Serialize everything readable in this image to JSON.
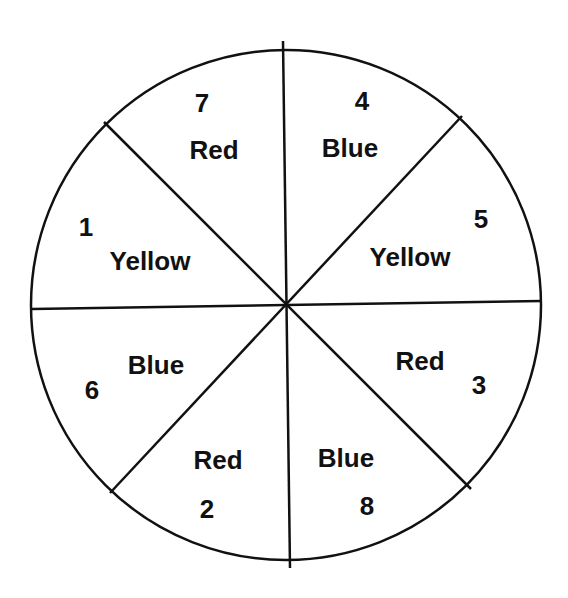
{
  "spinner": {
    "sections": [
      {
        "number": "7",
        "color": "Red"
      },
      {
        "number": "4",
        "color": "Blue"
      },
      {
        "number": "5",
        "color": "Yellow"
      },
      {
        "number": "3",
        "color": "Red"
      },
      {
        "number": "8",
        "color": "Blue"
      },
      {
        "number": "2",
        "color": "Red"
      },
      {
        "number": "6",
        "color": "Blue"
      },
      {
        "number": "1",
        "color": "Yellow"
      }
    ]
  }
}
